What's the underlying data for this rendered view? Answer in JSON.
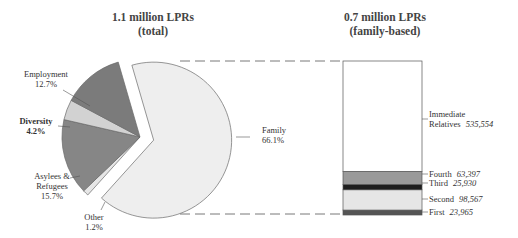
{
  "chart_data": [
    {
      "type": "pie",
      "title": "1.1 million LPRs",
      "subtitle": "(total)",
      "total_label": "1.1 million",
      "slices": [
        {
          "name": "Family",
          "label": "Family",
          "pct_label": "66.1%",
          "value": 66.1,
          "color": "#eeeeee",
          "exploded": true
        },
        {
          "name": "Other",
          "label": "Other",
          "pct_label": "1.2%",
          "value": 1.2,
          "color": "#e6e6e6",
          "exploded": false
        },
        {
          "name": "Asylees & Refugees",
          "label_lines": [
            "Asylees &",
            "Refugees"
          ],
          "pct_label": "15.7%",
          "value": 15.7,
          "color": "#868686",
          "exploded": false
        },
        {
          "name": "Diversity",
          "label": "Diversity",
          "pct_label": "4.2%",
          "value": 4.2,
          "color": "#d2d2d2",
          "exploded": false
        },
        {
          "name": "Employment",
          "label": "Employment",
          "pct_label": "12.7%",
          "value": 12.7,
          "color": "#7b7b7b",
          "exploded": false
        }
      ]
    },
    {
      "type": "bar",
      "stacked": true,
      "title": "0.7 million LPRs",
      "subtitle": "(family-based)",
      "categories": [
        "First",
        "Second",
        "Third",
        "Fourth",
        "Immediate Relatives"
      ],
      "values": [
        23965,
        98567,
        25930,
        63397,
        535554
      ],
      "value_labels": [
        "23,965",
        "98,567",
        "25,930",
        "63,397",
        "535,554"
      ],
      "label_lines": [
        [
          "First"
        ],
        [
          "Second"
        ],
        [
          "Third"
        ],
        [
          "Fourth"
        ],
        [
          "Immediate",
          "Relatives"
        ]
      ],
      "colors": [
        "#555555",
        "#e6e6e6",
        "#1e1e1e",
        "#9a9a9a",
        "#ffffff"
      ]
    }
  ]
}
